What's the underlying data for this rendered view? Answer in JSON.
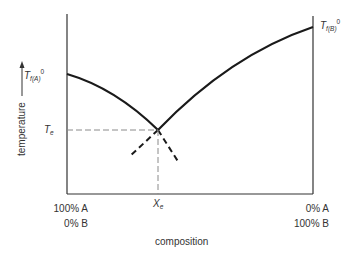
{
  "diagram": {
    "y_axis_label": "temperature",
    "x_axis_label": "composition",
    "left_melt_label": {
      "main": "T",
      "sub": "f(A)",
      "sup": "0"
    },
    "right_melt_label": {
      "main": "T",
      "sub": "f(B)",
      "sup": "0"
    },
    "eutectic_temp_label": {
      "main": "T",
      "sub": "e"
    },
    "eutectic_comp_label": {
      "main": "X",
      "sub": "e"
    },
    "left_composition": {
      "line1": "100%  A",
      "line2": "0%  B"
    },
    "right_composition": {
      "line1": "0%  A",
      "line2": "100%  B"
    },
    "colors": {
      "line": "#1a1a1a",
      "axis": "#333333",
      "guide": "#8a8a8a"
    }
  }
}
